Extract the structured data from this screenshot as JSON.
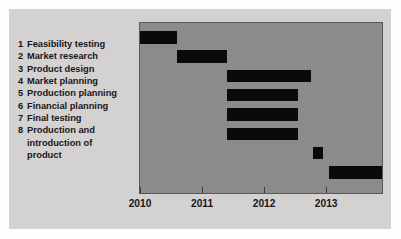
{
  "chart_data": {
    "type": "bar",
    "subtype": "gantt",
    "title": "",
    "xlabel": "",
    "ylabel": "",
    "grid": false,
    "legend": null,
    "xlim": [
      2010,
      2013.9
    ],
    "x_tick_labels": [
      "2010",
      "2011",
      "2012",
      "2013"
    ],
    "x_tick_values": [
      2010,
      2011,
      2012,
      2013
    ],
    "categories": [
      "Feasibility testing",
      "Market research",
      "Product design",
      "Market planning",
      "Production planning",
      "Financial planning",
      "Final testing",
      "Production and introduction of product"
    ],
    "tasks": [
      {
        "number": "1",
        "label": "Feasibility testing",
        "start": 2010.0,
        "end": 2010.6
      },
      {
        "number": "2",
        "label": "Market research",
        "start": 2010.6,
        "end": 2011.4
      },
      {
        "number": "3",
        "label": "Product design",
        "start": 2011.4,
        "end": 2012.75
      },
      {
        "number": "4",
        "label": "Market planning",
        "start": 2011.4,
        "end": 2012.55
      },
      {
        "number": "5",
        "label": "Production planning",
        "start": 2011.4,
        "end": 2012.55
      },
      {
        "number": "6",
        "label": "Financial planning",
        "start": 2011.4,
        "end": 2012.55
      },
      {
        "number": "7",
        "label": "Final testing",
        "start": 2012.78,
        "end": 2012.95
      },
      {
        "number": "8",
        "label": "Production and introduction of product",
        "start": 2013.05,
        "end": 2013.9
      }
    ],
    "bar_color": "#0a0a0a",
    "plot_background_color": "#8b8b8b",
    "panel_background_color": "#d4d2d0"
  },
  "task_list": [
    {
      "number": "1",
      "lines": [
        "Feasibility testing"
      ]
    },
    {
      "number": "2",
      "lines": [
        "Market research"
      ]
    },
    {
      "number": "3",
      "lines": [
        "Product design"
      ]
    },
    {
      "number": "4",
      "lines": [
        "Market planning"
      ]
    },
    {
      "number": "5",
      "lines": [
        "Production planning"
      ]
    },
    {
      "number": "6",
      "lines": [
        "Financial planning"
      ]
    },
    {
      "number": "7",
      "lines": [
        "Final testing"
      ]
    },
    {
      "number": "8",
      "lines": [
        "Production and",
        "introduction of",
        "product"
      ]
    }
  ]
}
